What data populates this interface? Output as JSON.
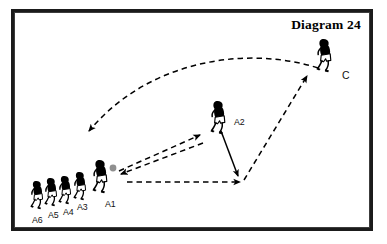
{
  "diagram": {
    "title": "Diagram 24",
    "background_color": "#ffffff",
    "ink_color": "#000000",
    "ball_color": "#8f8f8f",
    "frame": {
      "outer_color": "#1b1b1b",
      "inner_color": "#3c3c3c"
    },
    "players": [
      {
        "id": "A6",
        "label": "A6",
        "role": "queue-player",
        "x": 30,
        "y": 181,
        "label_x": 32,
        "label_y": 216
      },
      {
        "id": "A5",
        "label": "A5",
        "role": "queue-player",
        "x": 44,
        "y": 178,
        "label_x": 48,
        "label_y": 211
      },
      {
        "id": "A4",
        "label": "A4",
        "role": "queue-player",
        "x": 58,
        "y": 176,
        "label_x": 63,
        "label_y": 208
      },
      {
        "id": "A3",
        "label": "A3",
        "role": "queue-player",
        "x": 73,
        "y": 172,
        "label_x": 77,
        "label_y": 203
      },
      {
        "id": "A1",
        "label": "A1",
        "role": "passer-with-ball",
        "x": 92,
        "y": 160,
        "label_x": 105,
        "label_y": 200
      },
      {
        "id": "A2",
        "label": "A2",
        "role": "receiver",
        "x": 210,
        "y": 101,
        "label_x": 234,
        "label_y": 118
      },
      {
        "id": "C",
        "label": "C",
        "role": "coach",
        "x": 316,
        "y": 39,
        "label_x": 342,
        "label_y": 70
      }
    ],
    "balls": [
      {
        "owner": "A1",
        "x": 113,
        "y": 168,
        "r": 3.4
      }
    ],
    "arrows": [
      {
        "name": "coach-run-arc",
        "style": "dashed",
        "kind": "curve",
        "from": "C",
        "to": "A-line",
        "path": "M 318,68 C 250,46 150,58 89,131",
        "arrowhead_at": "end",
        "arrowhead_angle": 128
      },
      {
        "name": "a1-pass-to-a2",
        "style": "dashed",
        "kind": "line",
        "from": "A1",
        "to": "A2",
        "x1": 119,
        "y1": 171,
        "x2": 200,
        "y2": 135,
        "arrowhead_at": "end"
      },
      {
        "name": "a2-return-pass-to-a1",
        "style": "dashed",
        "kind": "line",
        "from": "A2",
        "to": "A1",
        "x1": 203,
        "y1": 143,
        "x2": 121,
        "y2": 174,
        "arrowhead_at": "end"
      },
      {
        "name": "a1-run-to-cone",
        "style": "dashed",
        "kind": "line",
        "from": "A1",
        "to": "support-point",
        "x1": 127,
        "y1": 182,
        "x2": 240,
        "y2": 182,
        "arrowhead_at": "end"
      },
      {
        "name": "a2-movement-down",
        "style": "solid",
        "kind": "line",
        "from": "A2",
        "to": "support-point",
        "x1": 221,
        "y1": 131,
        "x2": 238,
        "y2": 176,
        "arrowhead_at": "end"
      },
      {
        "name": "support-point-to-coach",
        "style": "dashed",
        "kind": "line",
        "from": "support-point",
        "to": "C",
        "x1": 244,
        "y1": 180,
        "x2": 307,
        "y2": 76,
        "arrowhead_at": "end"
      }
    ],
    "legend_notes": {
      "dashed_meaning": "pass / ball path",
      "solid_meaning": "player movement"
    }
  }
}
